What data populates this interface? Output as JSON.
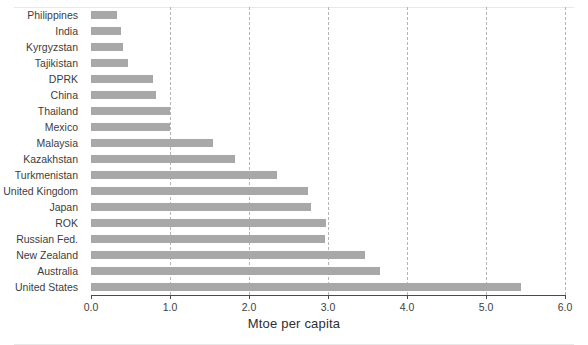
{
  "chart_data": {
    "type": "bar",
    "orientation": "horizontal",
    "title": "",
    "xlabel": "Mtoe per capita",
    "ylabel": "",
    "xlim": [
      0.0,
      6.0
    ],
    "xticks": [
      "0.0",
      "1.0",
      "2.0",
      "3.0",
      "4.0",
      "5.0",
      "6.0"
    ],
    "xtick_values": [
      0.0,
      1.0,
      2.0,
      3.0,
      4.0,
      5.0,
      6.0
    ],
    "grid": "vertical-dashed",
    "legend": "none",
    "bar_color": "#a8a8a8",
    "categories": [
      "Philippines",
      "India",
      "Kyrgyzstan",
      "Tajikistan",
      "DPRK",
      "China",
      "Thailand",
      "Mexico",
      "Malaysia",
      "Kazakhstan",
      "Turkmenistan",
      "United Kingdom",
      "Japan",
      "ROK",
      "Russian Fed.",
      "New Zealand",
      "Australia",
      "United States"
    ],
    "values": [
      0.33,
      0.38,
      0.41,
      0.47,
      0.78,
      0.82,
      1.0,
      1.0,
      1.55,
      1.82,
      2.35,
      2.75,
      2.78,
      2.97,
      2.96,
      3.47,
      3.66,
      5.44
    ]
  },
  "axis": {
    "x_title": "Mtoe per capita"
  }
}
